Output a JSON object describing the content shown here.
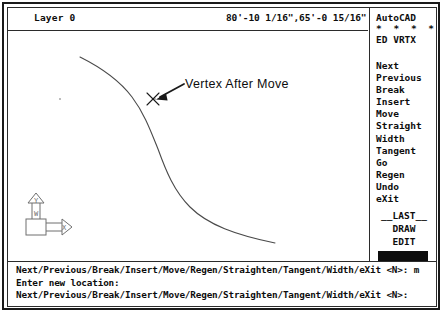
{
  "status_bar": {
    "layer_label": "Layer 0",
    "coordinates": "80'-10 1/16\",65'-0 15/16\""
  },
  "side_menu": {
    "title": "AutoCAD",
    "dots": "* * * *",
    "mode": "ED VRTX",
    "items": [
      {
        "label": "Next"
      },
      {
        "label": "Previous"
      },
      {
        "label": "Break"
      },
      {
        "label": "Insert"
      },
      {
        "label": "Move"
      },
      {
        "label": "Straight"
      },
      {
        "label": "Width"
      },
      {
        "label": "Tangent"
      },
      {
        "label": "Go"
      },
      {
        "label": "Regen"
      },
      {
        "label": "Undo"
      },
      {
        "label": "eXit"
      }
    ],
    "footer": [
      {
        "label": "__LAST__"
      },
      {
        "label": "DRAW"
      },
      {
        "label": "EDIT"
      }
    ]
  },
  "drawing": {
    "annotation": "Vertex After Move",
    "ucs_icon": {
      "x_label": "X",
      "y_label": "Y",
      "world_label": "W"
    }
  },
  "command_area": {
    "lines": [
      "Next/Previous/Break/Insert/Move/Regen/Straighten/Tangent/Width/eXit <N>: m",
      "Enter new location:",
      "Next/Previous/Break/Insert/Move/Regen/Straighten/Tangent/Width/eXit <N>:"
    ]
  },
  "colors": {
    "ink": "#0d0d0d",
    "line": "#2b2b2b",
    "curve": "#4a4a4a"
  }
}
